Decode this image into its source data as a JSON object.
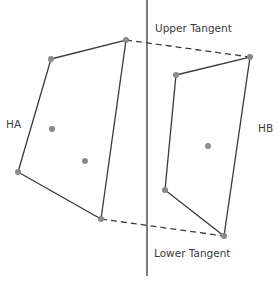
{
  "labels": {
    "upper_tangent": "Upper Tangent",
    "lower_tangent": "Lower Tangent",
    "hull_a": "HA",
    "hull_b": "HB"
  },
  "colors": {
    "line": "#3a3a3a",
    "point": "#8a8a8a",
    "background": "#ffffff"
  },
  "hull_a": {
    "vertices": [
      [
        51,
        59
      ],
      [
        126,
        40
      ],
      [
        101,
        219
      ],
      [
        18,
        172
      ]
    ],
    "interior_points": [
      [
        52,
        129
      ],
      [
        85,
        161
      ]
    ]
  },
  "hull_b": {
    "vertices": [
      [
        176,
        75
      ],
      [
        250,
        57
      ],
      [
        224,
        236
      ],
      [
        165,
        190
      ]
    ],
    "interior_points": [
      [
        208,
        146
      ]
    ]
  },
  "divider": {
    "x": 147,
    "y1": 0,
    "y2": 276
  },
  "upper_tangent": {
    "from": [
      126,
      40
    ],
    "to": [
      250,
      57
    ]
  },
  "lower_tangent": {
    "from": [
      101,
      219
    ],
    "to": [
      224,
      236
    ]
  }
}
